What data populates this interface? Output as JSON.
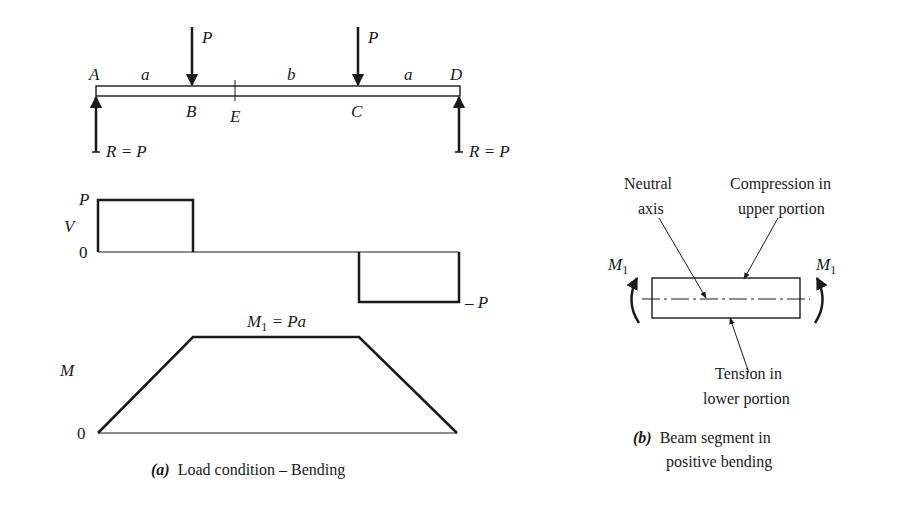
{
  "beam": {
    "support_left": "A",
    "support_right": "D",
    "point_B": "B",
    "point_C": "C",
    "point_E": "E",
    "span_left": "a",
    "span_middle": "b",
    "span_right": "a",
    "load_left": "P",
    "load_right": "P",
    "reaction_left": "R = P",
    "reaction_right": "R = P"
  },
  "shear_diagram": {
    "axis_label": "V",
    "top_label": "P",
    "zero_label": "0",
    "bottom_label": "– P"
  },
  "moment_diagram": {
    "axis_label": "M",
    "zero_label": "0",
    "peak_label_M": "M",
    "peak_label_sub": "1",
    "peak_label_rest": " = Pa"
  },
  "segment": {
    "moment_left_M": "M",
    "moment_left_sub": "1",
    "moment_right_M": "M",
    "moment_right_sub": "1",
    "neutral_axis_line1": "Neutral",
    "neutral_axis_line2": "axis",
    "compression_line1": "Compression in",
    "compression_line2": "upper portion",
    "tension_line1": "Tension in",
    "tension_line2": "lower portion"
  },
  "captions": {
    "a_tag": "(a)",
    "a_text": "Load condition – Bending",
    "b_tag": "(b)",
    "b_text_line1": "Beam segment in",
    "b_text_line2": "positive bending"
  },
  "colors": {
    "ink": "#1a1a1a",
    "background": "#ffffff"
  }
}
